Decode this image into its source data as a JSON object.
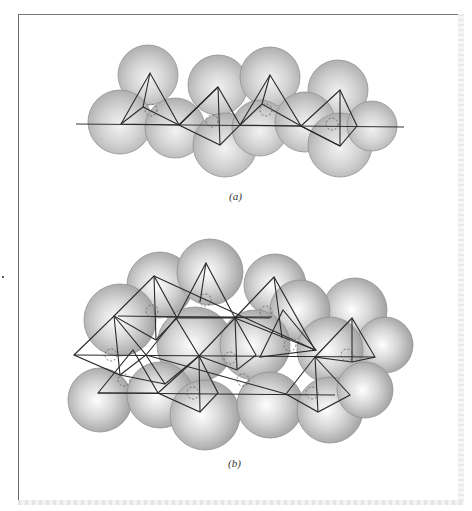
{
  "figure": {
    "panel_a": {
      "caption": "(a)",
      "description": "Single-chain silicate: SiO4 tetrahedra linked by shared corners, oxygen spheres with silicon atoms"
    },
    "panel_b": {
      "caption": "(b)",
      "description": "Double-chain silicate: two linked chains of SiO4 tetrahedra, oxygen spheres with silicon atoms"
    },
    "colors": {
      "sphere_fill": "#bdbdbd",
      "line": "#2a2a2a",
      "border": "#6a6a6a"
    }
  }
}
